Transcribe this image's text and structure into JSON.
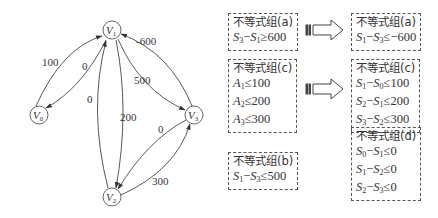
{
  "graph": {
    "nodes": [
      {
        "id": "V0",
        "label": "V",
        "sub": "0",
        "x": 39,
        "y": 115
      },
      {
        "id": "V1",
        "label": "V",
        "sub": "1",
        "x": 112,
        "y": 30
      },
      {
        "id": "V2",
        "label": "V",
        "sub": "2",
        "x": 112,
        "y": 197
      },
      {
        "id": "V3",
        "label": "V",
        "sub": "3",
        "x": 194,
        "y": 115
      }
    ],
    "edges": [
      {
        "from": "V0",
        "to": "V1",
        "weight": "100"
      },
      {
        "from": "V1",
        "to": "V0",
        "weight": "0"
      },
      {
        "from": "V2",
        "to": "V1",
        "weight": "0"
      },
      {
        "from": "V1",
        "to": "V2",
        "weight": "200"
      },
      {
        "from": "V1",
        "to": "V3",
        "weight": "500"
      },
      {
        "from": "V3",
        "to": "V1",
        "weight": "-600"
      },
      {
        "from": "V3",
        "to": "V2",
        "weight": "0"
      },
      {
        "from": "V2",
        "to": "V3",
        "weight": "300"
      }
    ]
  },
  "groups": {
    "a_left": {
      "title": "不等式组(a)",
      "lines": [
        {
          "lhs": "S",
          "lsub": "3",
          "op": "−",
          "rhs": "S",
          "rsub": "1",
          "rel": "≥",
          "val": "600"
        }
      ]
    },
    "a_right": {
      "title": "不等式组(a)",
      "lines": [
        {
          "lhs": "S",
          "lsub": "1",
          "op": "−",
          "rhs": "S",
          "rsub": "3",
          "rel": "≤",
          "val": "−600"
        }
      ]
    },
    "c_left": {
      "title": "不等式组(c)",
      "lines": [
        {
          "lhs": "A",
          "lsub": "1",
          "rel": "≤",
          "val": "100"
        },
        {
          "lhs": "A",
          "lsub": "2",
          "rel": "≤",
          "val": "200"
        },
        {
          "lhs": "A",
          "lsub": "3",
          "rel": "≤",
          "val": "300"
        }
      ]
    },
    "c_right": {
      "title": "不等式组(c)",
      "lines": [
        {
          "lhs": "S",
          "lsub": "1",
          "op": "−",
          "rhs": "S",
          "rsub": "0",
          "rel": "≤",
          "val": "100"
        },
        {
          "lhs": "S",
          "lsub": "2",
          "op": "−",
          "rhs": "S",
          "rsub": "1",
          "rel": "≤",
          "val": "200"
        },
        {
          "lhs": "S",
          "lsub": "3",
          "op": "−",
          "rhs": "S",
          "rsub": "2",
          "rel": "≤",
          "val": "300"
        }
      ]
    },
    "d": {
      "title": "不等式组(d)",
      "lines": [
        {
          "lhs": "S",
          "lsub": "0",
          "op": "−",
          "rhs": "S",
          "rsub": "1",
          "rel": "≤",
          "val": "0"
        },
        {
          "lhs": "S",
          "lsub": "1",
          "op": "−",
          "rhs": "S",
          "rsub": "2",
          "rel": "≤",
          "val": "0"
        },
        {
          "lhs": "S",
          "lsub": "2",
          "op": "−",
          "rhs": "S",
          "rsub": "3",
          "rel": "≤",
          "val": "0"
        }
      ]
    },
    "b": {
      "title": "不等式组(b)",
      "lines": [
        {
          "lhs": "S",
          "lsub": "1",
          "op": "−",
          "rhs": "S",
          "rsub": "3",
          "rel": "≤",
          "val": "500"
        }
      ]
    }
  }
}
